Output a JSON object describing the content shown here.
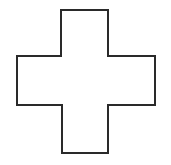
{
  "figure": {
    "shape": "cross-outline",
    "stroke_color": "#2a2a2a",
    "fill_color": "#ffffff",
    "background_color": "#ffffff",
    "stroke_width": 2,
    "outline_points": "61,10 108,10 108,56 155,56 155,105 108,105 108,153 62,153 62,105 17,105 17,56 61,56"
  }
}
